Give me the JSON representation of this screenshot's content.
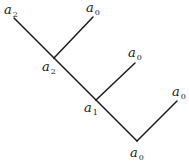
{
  "diagram": {
    "type": "binary-tree",
    "nodes": [
      {
        "id": "root_tip",
        "symbol": "a",
        "subscript": "2",
        "label": "a_2",
        "x": 14,
        "y": 18,
        "lx": 4,
        "ly": 14
      },
      {
        "id": "leaf1",
        "symbol": "a",
        "subscript": "0",
        "label": "a_0",
        "x": 93,
        "y": 17,
        "lx": 86,
        "ly": 12
      },
      {
        "id": "node_a2",
        "symbol": "a",
        "subscript": "2",
        "label": "a_2",
        "x": 54,
        "y": 58,
        "lx": 42,
        "ly": 71
      },
      {
        "id": "leaf2",
        "symbol": "a",
        "subscript": "0",
        "label": "a_0",
        "x": 135,
        "y": 63,
        "lx": 128,
        "ly": 57
      },
      {
        "id": "node_a1",
        "symbol": "a",
        "subscript": "1",
        "label": "a_1",
        "x": 96,
        "y": 100,
        "lx": 84,
        "ly": 112
      },
      {
        "id": "leaf3",
        "symbol": "a",
        "subscript": "0",
        "label": "a_0",
        "x": 177,
        "y": 101,
        "lx": 172,
        "ly": 96
      },
      {
        "id": "bottom",
        "symbol": "a",
        "subscript": "0",
        "label": "a_0",
        "x": 137,
        "y": 141,
        "lx": 130,
        "ly": 157
      }
    ],
    "edges": [
      {
        "from": "root_tip",
        "to": "node_a2"
      },
      {
        "from": "node_a2",
        "to": "leaf1"
      },
      {
        "from": "node_a2",
        "to": "node_a1"
      },
      {
        "from": "node_a1",
        "to": "leaf2"
      },
      {
        "from": "node_a1",
        "to": "bottom"
      },
      {
        "from": "bottom",
        "to": "leaf3"
      }
    ]
  }
}
